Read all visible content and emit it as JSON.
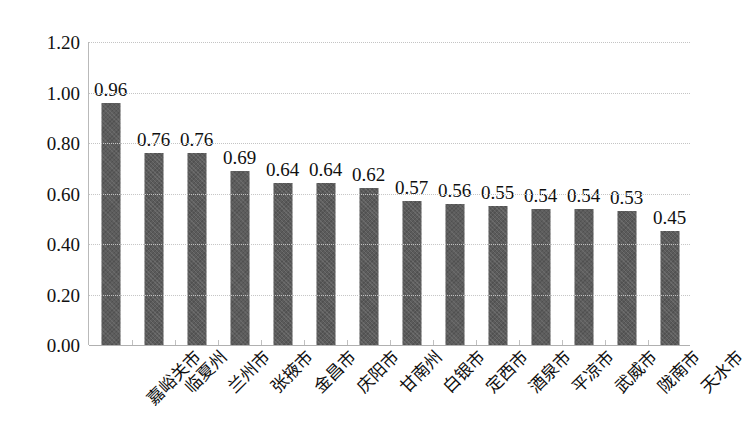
{
  "chart_data": {
    "type": "bar",
    "title": "",
    "subtitle": "",
    "xlabel": "",
    "ylabel": "",
    "ylim": [
      0,
      1.2
    ],
    "ytick_step": 0.2,
    "yticks": [
      "1.20",
      "1.00",
      "0.80",
      "0.60",
      "0.40",
      "0.20",
      "0.00"
    ],
    "ytick_values": [
      1.2,
      1.0,
      0.8,
      0.6,
      0.4,
      0.2,
      0.0
    ],
    "grid": true,
    "grid_axis": "y",
    "legend": "none",
    "bar_color": "#5b5b5b",
    "gridline_color": "#c4c4c4",
    "axis_color": "#b0b0b0",
    "categories": [
      "嘉峪关市",
      "临夏州",
      "兰州市",
      "张掖市",
      "金昌市",
      "庆阳市",
      "甘南州",
      "白银市",
      "定西市",
      "酒泉市",
      "平凉市",
      "武威市",
      "陇南市",
      "天水市"
    ],
    "values": [
      0.96,
      0.76,
      0.76,
      0.69,
      0.64,
      0.64,
      0.62,
      0.57,
      0.56,
      0.55,
      0.54,
      0.54,
      0.53,
      0.45
    ],
    "data_labels": [
      "0.96",
      "0.76",
      "0.76",
      "0.69",
      "0.64",
      "0.64",
      "0.62",
      "0.57",
      "0.56",
      "0.55",
      "0.54",
      "0.54",
      "0.53",
      "0.45"
    ]
  }
}
